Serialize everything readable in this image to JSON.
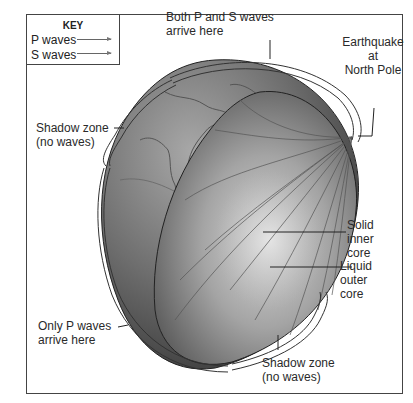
{
  "diagram": {
    "key": {
      "title": "KEY",
      "items": [
        {
          "label": "P waves",
          "symbol": "arrow"
        },
        {
          "label": "S waves",
          "symbol": "arrow"
        }
      ]
    },
    "labels": {
      "both_waves": {
        "line1": "Both P and S waves",
        "line2": "arrive here"
      },
      "earthquake": {
        "line1": "Earthquake",
        "line2": "at",
        "line3": "North Pole"
      },
      "shadow_zone_upper": {
        "line1": "Shadow zone",
        "line2": "(no waves)"
      },
      "solid_inner_core": {
        "line1": "Solid",
        "line2": "inner",
        "line3": "core"
      },
      "liquid_outer_core": {
        "line1": "Liquid",
        "line2": "outer",
        "line3": "core"
      },
      "only_p_waves": {
        "line1": "Only P waves",
        "line2": "arrive here"
      },
      "shadow_zone_lower": {
        "line1": "Shadow zone",
        "line2": "(no waves)"
      }
    },
    "colors": {
      "globe_dark": "#3a3a3a",
      "globe_mid": "#7a7a7a",
      "globe_light": "#c8c8c8",
      "line": "#333333",
      "background": "#ffffff"
    }
  }
}
